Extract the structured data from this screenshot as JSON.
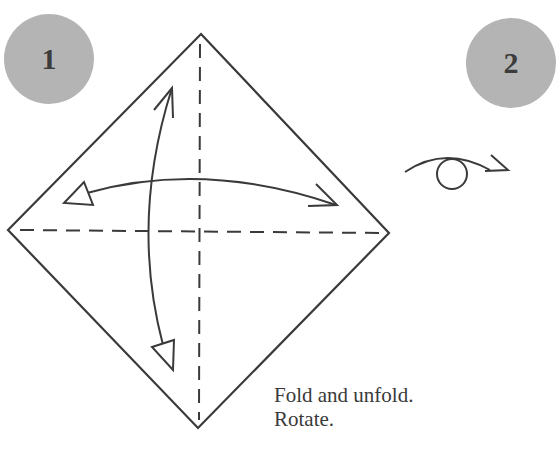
{
  "steps": [
    {
      "number": "1"
    },
    {
      "number": "2"
    }
  ],
  "instructions": {
    "line1": "Fold and unfold.",
    "line2": "Rotate."
  },
  "colors": {
    "badge": "#b4b4b4",
    "badge_text": "#3c3c3c",
    "line": "#3a3a3a",
    "background": "#ffffff"
  },
  "icons": {
    "fold_unfold_arrows": "double-headed-curved-arrow",
    "turn_over": "turn-over-loop-arrow-icon"
  }
}
